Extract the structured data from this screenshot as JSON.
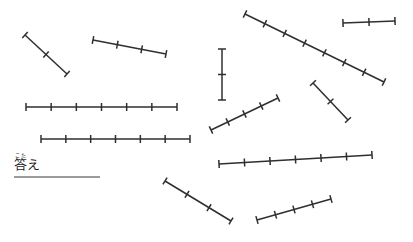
{
  "page": {
    "background_color": "#ffffff",
    "width": 413,
    "height": 242
  },
  "answer": {
    "furigana": "こた",
    "label": "答え",
    "rule_color": "#9b9b9b",
    "rule_width": 86
  },
  "style": {
    "stroke_color": "#2f2f33",
    "stroke_width": 1.5,
    "tick_width": 1.5,
    "tick_half_length": 4
  },
  "chart_data": {
    "type": "diagram",
    "segments": [
      {
        "id": 1,
        "x1": 25,
        "y1": 35,
        "x2": 67,
        "y2": 74,
        "divisions": 2,
        "interior_ticks": 1,
        "orientation": "diagonal-down-right"
      },
      {
        "id": 2,
        "x1": 93,
        "y1": 40,
        "x2": 166,
        "y2": 54,
        "divisions": 3,
        "interior_ticks": 2,
        "orientation": "shallow-down-right"
      },
      {
        "id": 3,
        "x1": 245,
        "y1": 14,
        "x2": 384,
        "y2": 82,
        "divisions": 7,
        "interior_ticks": 6,
        "orientation": "diagonal-down-right"
      },
      {
        "id": 4,
        "x1": 343,
        "y1": 23,
        "x2": 395,
        "y2": 21,
        "divisions": 2,
        "interior_ticks": 1,
        "orientation": "horizontal"
      },
      {
        "id": 5,
        "x1": 222,
        "y1": 49,
        "x2": 222,
        "y2": 100,
        "divisions": 2,
        "interior_ticks": 1,
        "orientation": "vertical"
      },
      {
        "id": 6,
        "x1": 26,
        "y1": 107,
        "x2": 177,
        "y2": 107,
        "divisions": 6,
        "interior_ticks": 5,
        "orientation": "horizontal"
      },
      {
        "id": 7,
        "x1": 41,
        "y1": 139,
        "x2": 190,
        "y2": 139,
        "divisions": 6,
        "interior_ticks": 5,
        "orientation": "horizontal"
      },
      {
        "id": 8,
        "x1": 211,
        "y1": 130,
        "x2": 278,
        "y2": 98,
        "divisions": 4,
        "interior_ticks": 3,
        "orientation": "diagonal-up-right"
      },
      {
        "id": 9,
        "x1": 313,
        "y1": 83,
        "x2": 348,
        "y2": 120,
        "divisions": 2,
        "interior_ticks": 1,
        "orientation": "diagonal-down-right"
      },
      {
        "id": 10,
        "x1": 219,
        "y1": 164,
        "x2": 372,
        "y2": 155,
        "divisions": 6,
        "interior_ticks": 5,
        "orientation": "shallow-up-right"
      },
      {
        "id": 11,
        "x1": 165,
        "y1": 181,
        "x2": 231,
        "y2": 221,
        "divisions": 3,
        "interior_ticks": 2,
        "orientation": "diagonal-down-right"
      },
      {
        "id": 12,
        "x1": 257,
        "y1": 220,
        "x2": 331,
        "y2": 199,
        "divisions": 4,
        "interior_ticks": 3,
        "orientation": "shallow-up-right"
      }
    ]
  }
}
